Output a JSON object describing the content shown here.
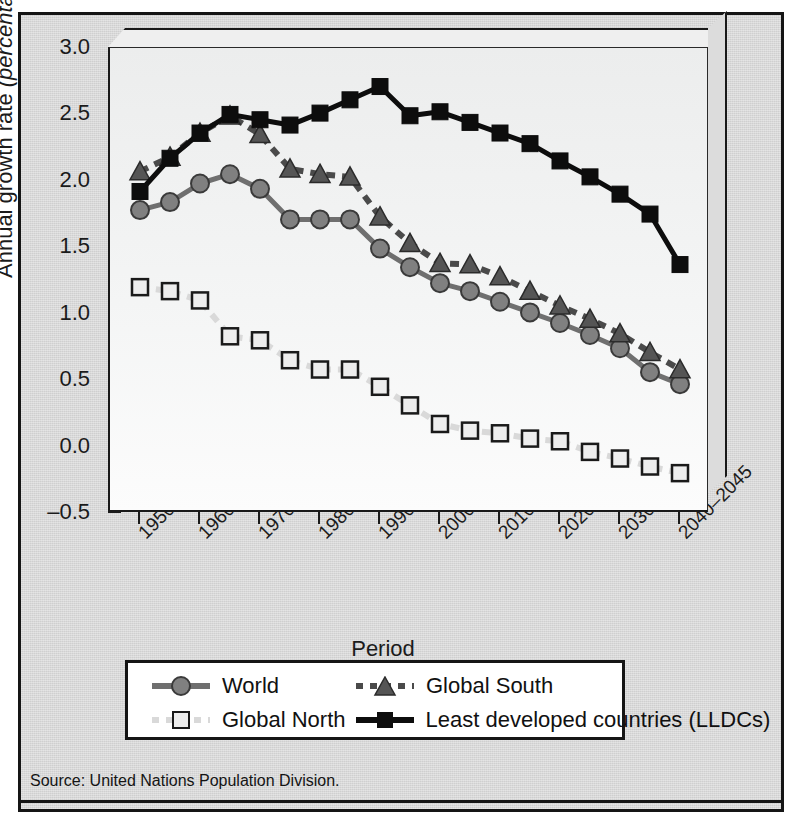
{
  "figure": {
    "source_note": "Source: United Nations Population Division."
  },
  "chart_data": {
    "type": "line",
    "title": "",
    "xlabel": "Period",
    "ylabel": "Annual growth rate (percentage)",
    "ylabel_plain": "Annual growth rate",
    "ylabel_italic": "(percentage)",
    "ylim": [
      -0.5,
      3.0
    ],
    "ytick_step": 0.5,
    "ytick_labels": [
      "3.0",
      "2.5",
      "2.0",
      "1.5",
      "1.0",
      "0.5",
      "0.0",
      "–0.5"
    ],
    "ytick_values": [
      3.0,
      2.5,
      2.0,
      1.5,
      1.0,
      0.5,
      0.0,
      -0.5
    ],
    "grid": false,
    "legend_position": "below-axes",
    "categories": [
      "1950–1955",
      "1955–1960",
      "1960–1965",
      "1965–1970",
      "1970–1975",
      "1975–1980",
      "1980–1985",
      "1985–1990",
      "1990–1995",
      "1995–2000",
      "2000–2005",
      "2005–2010",
      "2010–2015",
      "2015–2020",
      "2020–2025",
      "2025–2030",
      "2030–2035",
      "2035–2040",
      "2040–2045"
    ],
    "xtick_labels": [
      "1950–1955",
      "1960–1965",
      "1970–1975",
      "1980–1985",
      "1990–1995",
      "2000–2005",
      "2010–2015",
      "2020–2025",
      "2030–2035",
      "2040–2045"
    ],
    "xtick_indices": [
      0,
      2,
      4,
      6,
      8,
      10,
      12,
      14,
      16,
      18
    ],
    "series": [
      {
        "name": "World",
        "marker": "circle",
        "line": "solid",
        "color": "#6f6f6f",
        "marker_fill": "#808080",
        "marker_edge": "#3a3a3a",
        "values": [
          1.78,
          1.84,
          1.98,
          2.05,
          1.94,
          1.71,
          1.71,
          1.71,
          1.49,
          1.35,
          1.23,
          1.17,
          1.09,
          1.01,
          0.93,
          0.84,
          0.74,
          0.56,
          0.47
        ]
      },
      {
        "name": "Global North",
        "marker": "square-open",
        "line": "dashed",
        "color": "#d9d9d9",
        "marker_fill": "#ededed",
        "marker_edge": "#1a1a1a",
        "values": [
          1.2,
          1.17,
          1.1,
          0.83,
          0.8,
          0.65,
          0.58,
          0.58,
          0.45,
          0.31,
          0.17,
          0.12,
          0.1,
          0.06,
          0.04,
          -0.04,
          -0.09,
          -0.15,
          -0.2
        ]
      },
      {
        "name": "Global South",
        "marker": "triangle",
        "line": "dashed",
        "color": "#4a4a4a",
        "marker_fill": "#555555",
        "marker_edge": "#2b2b2b",
        "values": [
          2.07,
          2.18,
          2.36,
          2.49,
          2.35,
          2.09,
          2.05,
          2.03,
          1.73,
          1.53,
          1.38,
          1.37,
          1.28,
          1.17,
          1.06,
          0.96,
          0.85,
          0.71,
          0.58
        ]
      },
      {
        "name": "Least developed countries (LLDCs)",
        "marker": "square-filled",
        "line": "solid",
        "color": "#0d0d0d",
        "marker_fill": "#0d0d0d",
        "marker_edge": "#0d0d0d",
        "values": [
          1.92,
          2.17,
          2.36,
          2.5,
          2.46,
          2.42,
          2.51,
          2.61,
          2.71,
          2.49,
          2.52,
          2.44,
          2.36,
          2.28,
          2.15,
          2.03,
          1.9,
          1.75,
          1.37
        ]
      }
    ]
  },
  "legend": {
    "entries": [
      {
        "label": "World"
      },
      {
        "label": "Global South"
      },
      {
        "label": "Global North"
      },
      {
        "label": "Least developed countries (LLDCs)"
      }
    ]
  }
}
